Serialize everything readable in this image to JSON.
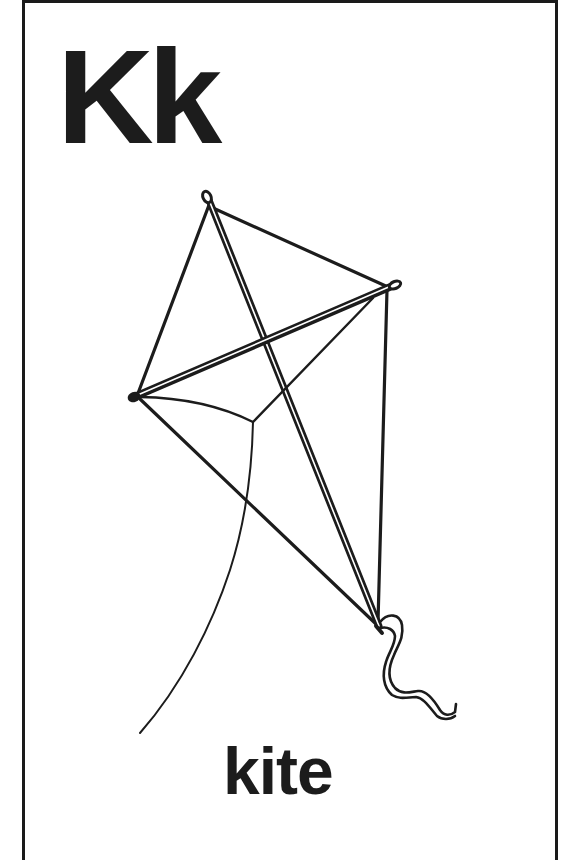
{
  "card": {
    "letters": "Kk",
    "word": "kite"
  },
  "illustration": {
    "subject": "kite",
    "icon": "kite-icon",
    "parts": [
      "frame-spine",
      "cross-spar",
      "edges",
      "bridle",
      "string",
      "tail-ribbon"
    ]
  },
  "colors": {
    "ink": "#1c1c1c",
    "background": "#ffffff",
    "border": "#1a1a1a"
  }
}
